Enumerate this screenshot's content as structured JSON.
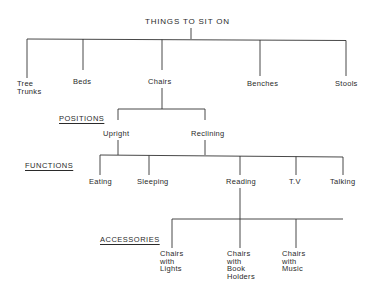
{
  "diagram": {
    "type": "tree",
    "title": "THINGS TO SIT ON",
    "level1": [
      {
        "label": "Tree\nTrunks"
      },
      {
        "label": "Beds"
      },
      {
        "label": "Chairs"
      },
      {
        "label": "Benches"
      },
      {
        "label": "Stools"
      }
    ],
    "categories": {
      "positions": "POSITIONS",
      "functions": "FUNCTIONS",
      "accessories": "ACCESSORIES"
    },
    "positions": [
      {
        "label": "Upright"
      },
      {
        "label": "Reclining"
      }
    ],
    "functions": [
      {
        "label": "Eating"
      },
      {
        "label": "Sleeping"
      },
      {
        "label": "Reading"
      },
      {
        "label": "T.V"
      },
      {
        "label": "Talking"
      }
    ],
    "accessories": [
      {
        "label": "Chairs\nwith\nLights"
      },
      {
        "label": "Chairs\nwith\nBook\nHolders"
      },
      {
        "label": "Chairs\nwith\nMusic"
      }
    ],
    "line_color": "#333333"
  }
}
